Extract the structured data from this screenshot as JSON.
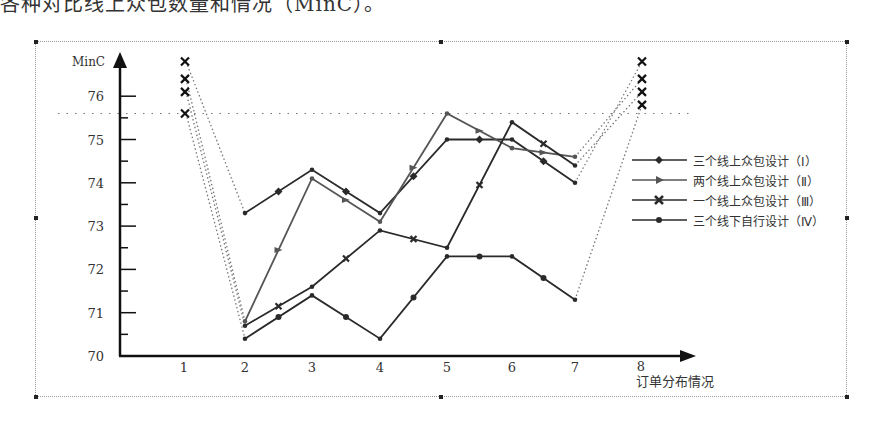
{
  "document": {
    "top_cropped_text": "各种对比线上众包数量和情况（MinC）。"
  },
  "chart_data": {
    "type": "line",
    "title": "",
    "xlabel": "订单分布情况",
    "ylabel": "MinC",
    "x": [
      1,
      2,
      3,
      4,
      5,
      6,
      7,
      8
    ],
    "x_tick_labels": [
      "1",
      "2",
      "3",
      "4",
      "5",
      "6",
      "7",
      "8"
    ],
    "y_tick_labels": [
      "70",
      "71",
      "72",
      "73",
      "74",
      "75",
      "76"
    ],
    "ylim": [
      70,
      76.5
    ],
    "grid": false,
    "reference_line": {
      "y": 75.6,
      "style": "dotted"
    },
    "legend_position": "right",
    "series": [
      {
        "name": "三个线上众包设计（Ⅰ）",
        "marker": "diamond",
        "x": [
          2,
          3,
          4,
          5,
          6,
          7
        ],
        "values": [
          73.3,
          74.3,
          73.3,
          75.0,
          75.0,
          74.0
        ]
      },
      {
        "name": "两个线上众包设计（Ⅱ）",
        "marker": "triangle",
        "x": [
          2,
          3,
          4,
          5,
          6,
          7
        ],
        "values": [
          70.8,
          74.1,
          73.1,
          75.6,
          74.8,
          74.6
        ]
      },
      {
        "name": "一个线上众包设计（Ⅲ）",
        "marker": "x",
        "x": [
          2,
          3,
          4,
          5,
          6,
          7
        ],
        "values": [
          70.7,
          71.6,
          72.9,
          72.5,
          75.4,
          74.4
        ]
      },
      {
        "name": "三个线下自行设计（Ⅳ）",
        "marker": "circle",
        "x": [
          2,
          3,
          4,
          5,
          6,
          7
        ],
        "values": [
          70.4,
          71.4,
          70.4,
          72.3,
          72.3,
          71.3
        ]
      }
    ],
    "dotted_extensions": {
      "x1_markers_y": [
        76.8,
        76.4,
        76.1,
        75.6
      ],
      "x8_markers_y": [
        76.8,
        76.4,
        76.1,
        75.8
      ]
    }
  },
  "legend": {
    "items": [
      {
        "label": "三个线上众包设计（Ⅰ）"
      },
      {
        "label": "两个线上众包设计（Ⅱ）"
      },
      {
        "label": "一个线上众包设计（Ⅲ）"
      },
      {
        "label": "三个线下自行设计（Ⅳ）"
      }
    ]
  },
  "colors": {
    "line": "#2a2a2a",
    "series2": "#555555",
    "dotted": "#777777"
  }
}
